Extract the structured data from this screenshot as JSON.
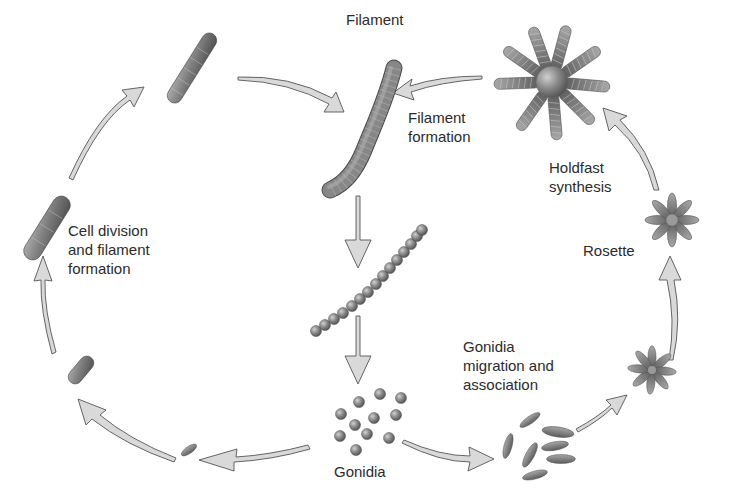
{
  "diagram": {
    "type": "life-cycle",
    "colors": {
      "organism_fill": "#8a8a8a",
      "organism_dark": "#5a5a5a",
      "organism_light": "#b8b8b8",
      "arrow_fill": "#d9d9d9",
      "arrow_stroke": "#555555",
      "text": "#2b2b2b",
      "background": "#ffffff"
    },
    "labels": {
      "filament": "Filament",
      "filament_formation": "Filament\nformation",
      "holdfast_synthesis": "Holdfast\nsynthesis",
      "rosette": "Rosette",
      "gonidia_migration": "Gonidia\nmigration and\nassociation",
      "gonidia": "Gonidia",
      "cell_division": "Cell division\nand filament\nformation"
    },
    "stages": [
      {
        "id": "filament",
        "label": "Filament",
        "icon": "long-segmented-filament"
      },
      {
        "id": "chain",
        "label": "",
        "icon": "bead-chain"
      },
      {
        "id": "gonidia",
        "label": "Gonidia",
        "icon": "dispersed-round-cells"
      },
      {
        "id": "migration",
        "label": "Gonidia migration and association",
        "icon": "scattered-spindle-cells"
      },
      {
        "id": "small-rosette",
        "label": "",
        "icon": "small-rosette"
      },
      {
        "id": "rosette",
        "label": "Rosette",
        "icon": "rosette"
      },
      {
        "id": "holdfast-rosette",
        "label": "Holdfast synthesis",
        "icon": "filaments-rosette"
      },
      {
        "id": "single-cell",
        "label": "",
        "icon": "single-spindle-cell"
      },
      {
        "id": "short-rod",
        "label": "",
        "icon": "short-rod"
      },
      {
        "id": "dividing-rod",
        "label": "Cell division and filament formation",
        "icon": "dividing-rod"
      },
      {
        "id": "short-filament",
        "label": "",
        "icon": "short-filament"
      }
    ]
  }
}
